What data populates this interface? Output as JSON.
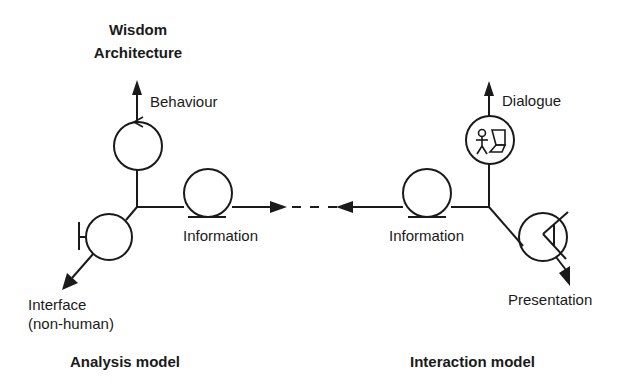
{
  "title": {
    "line1": "Wisdom",
    "line2": "Architecture"
  },
  "analysis_model": {
    "caption": "Analysis model",
    "axes": {
      "behaviour": "Behaviour",
      "information": "Information",
      "interface_line1": "Interface",
      "interface_line2": "(non-human)"
    },
    "elements": [
      {
        "type": "control-class",
        "axis": "Behaviour"
      },
      {
        "type": "entity-class",
        "axis": "Information"
      },
      {
        "type": "boundary-class",
        "axis": "Interface (non-human)"
      }
    ]
  },
  "interaction_model": {
    "caption": "Interaction model",
    "axes": {
      "dialogue": "Dialogue",
      "information": "Information",
      "presentation": "Presentation"
    },
    "elements": [
      {
        "type": "task-class",
        "axis": "Dialogue"
      },
      {
        "type": "entity-class",
        "axis": "Information"
      },
      {
        "type": "view-class",
        "axis": "Presentation"
      }
    ]
  },
  "connector": {
    "style": "dashed",
    "description": "Information axes of both models point toward each other"
  },
  "colors": {
    "ink": "#1a1a1a",
    "background": "#ffffff"
  }
}
